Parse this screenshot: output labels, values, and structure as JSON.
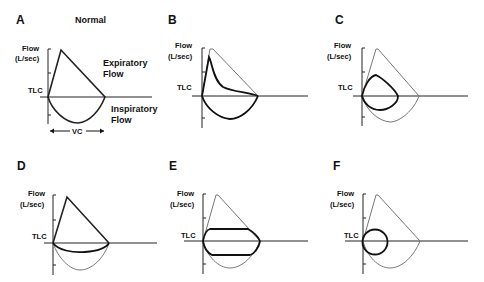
{
  "figure": {
    "panels": [
      {
        "id": "A",
        "letter": "A",
        "title": "Normal",
        "flow_label_1": "Flow",
        "flow_label_2": "(L/sec)",
        "tlc_label": "TLC",
        "expiratory_label_1": "Expiratory",
        "expiratory_label_2": "Flow",
        "inspiratory_label_1": "Inspiratory",
        "inspiratory_label_2": "Flow",
        "vc_label": "VC"
      },
      {
        "id": "B",
        "letter": "B",
        "flow_label_1": "Flow",
        "flow_label_2": "(L/sec)",
        "tlc_label": "TLC"
      },
      {
        "id": "C",
        "letter": "C",
        "flow_label_1": "Flow",
        "flow_label_2": "(L/sec)",
        "tlc_label": "TLC"
      },
      {
        "id": "D",
        "letter": "D",
        "flow_label_1": "Flow",
        "flow_label_2": "(L/sec)",
        "tlc_label": "TLC"
      },
      {
        "id": "E",
        "letter": "E",
        "flow_label_1": "Flow",
        "flow_label_2": "(L/sec)",
        "tlc_label": "TLC"
      },
      {
        "id": "F",
        "letter": "F",
        "flow_label_1": "Flow",
        "flow_label_2": "(L/sec)",
        "tlc_label": "TLC"
      }
    ]
  },
  "colors": {
    "normal_curve": "#222222",
    "reference_curve": "#777777",
    "pathologic_curve": "#111111",
    "background": "#ffffff"
  }
}
